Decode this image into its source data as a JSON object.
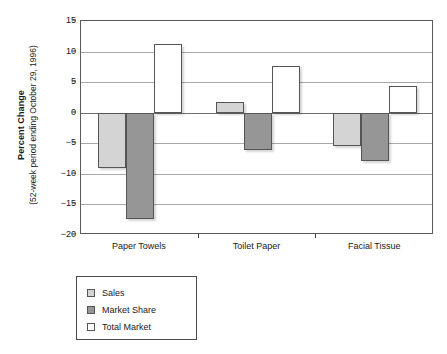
{
  "chart_data": {
    "type": "bar",
    "title": "",
    "subtitle": "",
    "xlabel": "",
    "ylabel": "Percent Change",
    "ylabel_line2": "(52-week period ending October 29, 1996)",
    "categories": [
      "Paper Towels",
      "Toilet Paper",
      "Facial Tissue"
    ],
    "series": [
      {
        "name": "Sales",
        "values": [
          -9.0,
          1.7,
          -5.4
        ],
        "color": "#d4d4d4"
      },
      {
        "name": "Market Share",
        "values": [
          -17.4,
          -6.1,
          -7.9
        ],
        "color": "#969696"
      },
      {
        "name": "Total Market",
        "values": [
          11.2,
          7.7,
          4.4
        ],
        "color": "#ffffff"
      }
    ],
    "ylim": [
      -20,
      15
    ],
    "yticks": [
      15,
      10,
      5,
      0,
      -5,
      -10,
      -15,
      -20
    ],
    "ytick_labels": [
      "15",
      "10",
      "5",
      "0",
      "−5",
      "−10",
      "−15",
      "−20"
    ],
    "grid": true,
    "grid_axis": "y",
    "legend_position": "below-left",
    "legend_entries": [
      "Sales",
      "Market Share",
      "Total Market"
    ]
  },
  "colors": {
    "sales": "#d4d4d4",
    "market_share": "#969696",
    "total_market": "#ffffff",
    "bar_border": "#555555",
    "gridline": "#a8a8a8",
    "axis": "#5a5a5a",
    "text": "#1a1a1a",
    "background": "#ffffff"
  }
}
